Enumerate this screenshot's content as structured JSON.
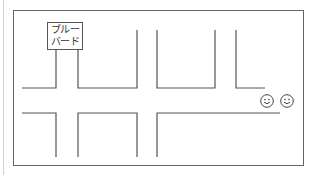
{
  "diagram": {
    "type": "street-map",
    "colors": {
      "line": "#555555",
      "faint": "#cccccc",
      "background": "#ffffff"
    },
    "landmark": {
      "name_line1": "ブルー",
      "name_line2": "バード",
      "name": "ブルーバード"
    },
    "people": [
      {
        "icon": "smiley-face-icon"
      },
      {
        "icon": "smiley-face-icon"
      }
    ]
  }
}
